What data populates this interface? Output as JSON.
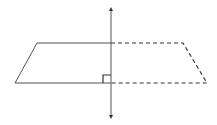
{
  "diagram": {
    "colors": {
      "background": "#ffffff",
      "stroke": "#555555",
      "arrow": "#333333"
    },
    "plane": {
      "solid_left": {
        "points": [
          [
            37,
            43
          ],
          [
            111,
            43
          ],
          [
            111,
            83
          ],
          [
            15,
            83
          ]
        ],
        "style": "solid"
      },
      "dashed_right": {
        "points": [
          [
            111,
            43
          ],
          [
            183,
            43
          ],
          [
            207,
            83
          ],
          [
            111,
            83
          ]
        ],
        "style": "dashed"
      }
    },
    "perpendicular_line": {
      "x": 111,
      "y_top": 8,
      "y_bottom": 118,
      "arrowheads": [
        "up",
        "down"
      ]
    },
    "right_angle_marker": {
      "x": 103,
      "y": 75,
      "size": 8
    }
  }
}
